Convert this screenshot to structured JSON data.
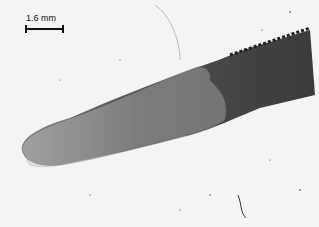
{
  "image": {
    "description": "Micrograph of a worm-like specimen (anterior end) with translucent sheath, on speckled light background",
    "scale_bar": {
      "label": "1.6 mm"
    }
  }
}
